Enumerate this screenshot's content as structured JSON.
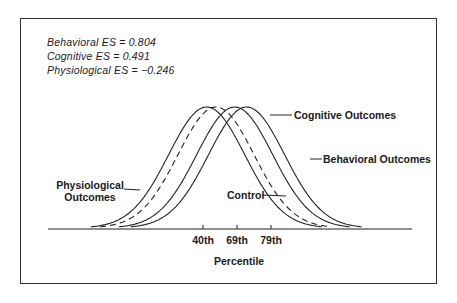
{
  "chart_data": {
    "type": "line",
    "title": "",
    "xlabel": "Percentile",
    "ylabel": "",
    "grid": false,
    "x_ticks": [
      "40th",
      "69th",
      "79th"
    ],
    "annotations": [
      "Behavioral ES = 0.804",
      "Cognitive ES = 0.491",
      "Physiological ES = −0.246"
    ],
    "series": [
      {
        "name": "Control",
        "style": "dashed",
        "mean_sd_shift": 0
      },
      {
        "name": "Physiological Outcomes",
        "style": "solid",
        "mean_sd_shift": -0.246
      },
      {
        "name": "Cognitive Outcomes",
        "style": "solid",
        "mean_sd_shift": 0.491
      },
      {
        "name": "Behavioral Outcomes",
        "style": "solid",
        "mean_sd_shift": 0.804
      }
    ],
    "effect_sizes": {
      "behavioral": 0.804,
      "cognitive": 0.491,
      "physiological": -0.246
    }
  },
  "labels": {
    "es_behavioral": "Behavioral ES = 0.804",
    "es_cognitive": "Cognitive ES = 0.491",
    "es_physiological": "Physiological ES = −0.246",
    "cognitive": "Cognitive Outcomes",
    "behavioral": "Behavioral Outcomes",
    "physiological_line1": "Physiological",
    "physiological_line2": "Outcomes",
    "control": "Control",
    "tick_40": "40th",
    "tick_69": "69th",
    "tick_79": "79th",
    "xlabel": "Percentile"
  }
}
